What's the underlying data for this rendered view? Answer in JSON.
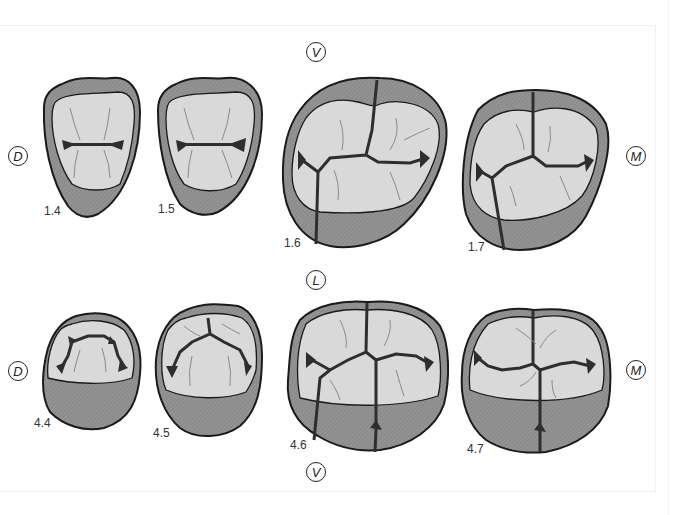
{
  "figure": {
    "type": "dental occlusal view diagram",
    "orientation_labels": {
      "top_vestibular": "V",
      "middle_lingual": "L",
      "bottom_vestibular": "V",
      "upper_distal": "D",
      "upper_mesial": "M",
      "lower_distal": "D",
      "lower_mesial": "M"
    },
    "upper_row": {
      "teeth": [
        {
          "id": "1.4",
          "label": "1.4",
          "type": "premolar"
        },
        {
          "id": "1.5",
          "label": "1.5",
          "type": "premolar"
        },
        {
          "id": "1.6",
          "label": "1.6",
          "type": "molar"
        },
        {
          "id": "1.7",
          "label": "1.7",
          "type": "molar"
        }
      ]
    },
    "lower_row": {
      "teeth": [
        {
          "id": "4.4",
          "label": "4.4",
          "type": "premolar"
        },
        {
          "id": "4.5",
          "label": "4.5",
          "type": "premolar"
        },
        {
          "id": "4.6",
          "label": "4.6",
          "type": "molar"
        },
        {
          "id": "4.7",
          "label": "4.7",
          "type": "molar"
        }
      ]
    },
    "colors": {
      "outline": "#1a1a1a",
      "wall_shade": "#8e8e8e",
      "occlusal_surface": "#d9d9d9",
      "fissure": "#2e2e2e",
      "ridge_line": "#8a8a8a"
    }
  }
}
